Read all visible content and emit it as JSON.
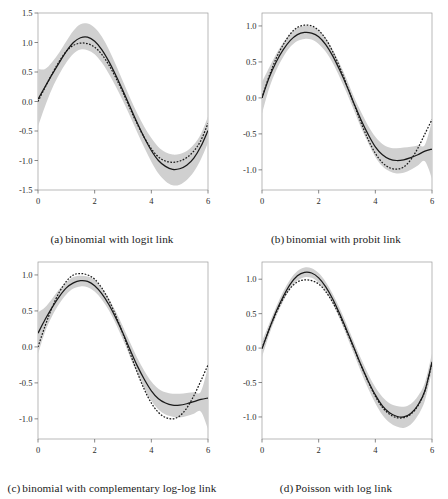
{
  "figure": {
    "title": "",
    "panel_count": 4
  },
  "chart_data": [
    {
      "type": "line",
      "panel": "a",
      "caption_tag": "(a)",
      "caption": "binomial with logit link",
      "title": "binomial with logit link",
      "xlabel": "",
      "ylabel": "",
      "xlim": [
        0,
        6
      ],
      "ylim": [
        -1.5,
        1.5
      ],
      "xticks": [
        0,
        2,
        4,
        6
      ],
      "xticklabels": [
        "0",
        "2",
        "4",
        "6"
      ],
      "yticks": [
        -1.5,
        -1.0,
        -0.5,
        0.0,
        0.5,
        1.0,
        1.5
      ],
      "yticklabels": [
        "-1.5",
        "-1.0",
        "-0.5",
        "0.0",
        "0.5",
        "1.0",
        "1.5"
      ],
      "grid": false,
      "legend": "none",
      "x": [
        0.0,
        0.25,
        0.5,
        0.75,
        1.0,
        1.25,
        1.5,
        1.75,
        2.0,
        2.25,
        2.5,
        2.75,
        3.0,
        3.25,
        3.5,
        3.75,
        4.0,
        4.25,
        4.5,
        4.75,
        5.0,
        5.25,
        5.5,
        5.75,
        6.0
      ],
      "series": [
        {
          "name": "estimate",
          "style": "solid",
          "color": "#1a1a1a",
          "values": [
            0.04,
            0.25,
            0.46,
            0.66,
            0.85,
            1.0,
            1.08,
            1.09,
            1.02,
            0.88,
            0.68,
            0.44,
            0.18,
            -0.09,
            -0.36,
            -0.61,
            -0.83,
            -1.0,
            -1.1,
            -1.15,
            -1.14,
            -1.08,
            -0.96,
            -0.76,
            -0.49
          ]
        },
        {
          "name": "true function",
          "style": "dashed",
          "color": "#1a1a1a",
          "values": [
            0.0,
            0.24,
            0.47,
            0.68,
            0.85,
            0.95,
            0.99,
            0.98,
            0.92,
            0.8,
            0.62,
            0.4,
            0.15,
            -0.12,
            -0.38,
            -0.61,
            -0.8,
            -0.94,
            -1.01,
            -1.03,
            -1.01,
            -0.95,
            -0.84,
            -0.66,
            -0.37
          ]
        },
        {
          "name": "ci-upper",
          "style": "band",
          "color": "#d0d0d0",
          "values": [
            0.55,
            0.55,
            0.67,
            0.83,
            1.02,
            1.2,
            1.31,
            1.32,
            1.25,
            1.1,
            0.88,
            0.62,
            0.34,
            0.06,
            -0.2,
            -0.43,
            -0.62,
            -0.77,
            -0.86,
            -0.9,
            -0.89,
            -0.84,
            -0.73,
            -0.55,
            -0.26
          ]
        },
        {
          "name": "ci-lower",
          "style": "band",
          "color": "#d0d0d0",
          "values": [
            -0.42,
            -0.08,
            0.22,
            0.46,
            0.66,
            0.81,
            0.88,
            0.87,
            0.8,
            0.66,
            0.47,
            0.25,
            0.01,
            -0.25,
            -0.52,
            -0.78,
            -1.02,
            -1.22,
            -1.35,
            -1.42,
            -1.41,
            -1.33,
            -1.19,
            -0.98,
            -0.7
          ]
        }
      ]
    },
    {
      "type": "line",
      "panel": "b",
      "caption_tag": "(b)",
      "caption": "binomial with probit link",
      "title": "binomial with probit link",
      "xlabel": "",
      "ylabel": "",
      "xlim": [
        0,
        6
      ],
      "ylim": [
        -1.28,
        1.18
      ],
      "xticks": [
        0,
        2,
        4,
        6
      ],
      "xticklabels": [
        "0",
        "2",
        "4",
        "6"
      ],
      "yticks": [
        -1.0,
        -0.5,
        0.0,
        0.5,
        1.0
      ],
      "yticklabels": [
        "-1.0",
        "-0.5",
        "0.0",
        "0.5",
        "1.0"
      ],
      "grid": false,
      "legend": "none",
      "x": [
        0.0,
        0.25,
        0.5,
        0.75,
        1.0,
        1.25,
        1.5,
        1.75,
        2.0,
        2.25,
        2.5,
        2.75,
        3.0,
        3.25,
        3.5,
        3.75,
        4.0,
        4.25,
        4.5,
        4.75,
        5.0,
        5.25,
        5.5,
        5.75,
        6.0
      ],
      "series": [
        {
          "name": "estimate",
          "style": "solid",
          "color": "#1a1a1a",
          "values": [
            0.0,
            0.28,
            0.5,
            0.67,
            0.8,
            0.88,
            0.91,
            0.9,
            0.85,
            0.74,
            0.58,
            0.38,
            0.16,
            -0.08,
            -0.31,
            -0.51,
            -0.68,
            -0.79,
            -0.85,
            -0.87,
            -0.86,
            -0.83,
            -0.79,
            -0.74,
            -0.71
          ]
        },
        {
          "name": "true function",
          "style": "dashed",
          "color": "#1a1a1a",
          "values": [
            0.0,
            0.3,
            0.55,
            0.74,
            0.89,
            0.98,
            1.01,
            1.0,
            0.94,
            0.82,
            0.64,
            0.42,
            0.17,
            -0.09,
            -0.35,
            -0.58,
            -0.77,
            -0.9,
            -0.97,
            -0.99,
            -0.96,
            -0.86,
            -0.7,
            -0.5,
            -0.3
          ]
        },
        {
          "name": "ci-upper",
          "style": "band",
          "color": "#d0d0d0",
          "values": [
            0.22,
            0.42,
            0.61,
            0.77,
            0.89,
            0.97,
            1.0,
            0.99,
            0.94,
            0.83,
            0.67,
            0.47,
            0.25,
            0.01,
            -0.2,
            -0.39,
            -0.54,
            -0.64,
            -0.69,
            -0.7,
            -0.69,
            -0.68,
            -0.66,
            -0.65,
            -0.32
          ]
        },
        {
          "name": "ci-lower",
          "style": "band",
          "color": "#d0d0d0",
          "values": [
            -0.22,
            0.13,
            0.38,
            0.57,
            0.71,
            0.79,
            0.82,
            0.81,
            0.75,
            0.64,
            0.48,
            0.28,
            0.06,
            -0.18,
            -0.42,
            -0.63,
            -0.82,
            -0.95,
            -1.02,
            -1.05,
            -1.04,
            -1.0,
            -0.94,
            -0.88,
            -1.12
          ]
        }
      ]
    },
    {
      "type": "line",
      "panel": "c",
      "caption_tag": "(c)",
      "caption": "binomial with complementary log-log link",
      "title": "binomial with complementary log-log link",
      "xlabel": "",
      "ylabel": "",
      "xlim": [
        0,
        6
      ],
      "ylim": [
        -1.28,
        1.18
      ],
      "xticks": [
        0,
        2,
        4,
        6
      ],
      "xticklabels": [
        "0",
        "2",
        "4",
        "6"
      ],
      "yticks": [
        -1.0,
        -0.5,
        0.0,
        0.5,
        1.0
      ],
      "yticklabels": [
        "-1.0",
        "-0.5",
        "0.0",
        "0.5",
        "1.0"
      ],
      "grid": false,
      "legend": "none",
      "x": [
        0.0,
        0.25,
        0.5,
        0.75,
        1.0,
        1.25,
        1.5,
        1.75,
        2.0,
        2.25,
        2.5,
        2.75,
        3.0,
        3.25,
        3.5,
        3.75,
        4.0,
        4.25,
        4.5,
        4.75,
        5.0,
        5.25,
        5.5,
        5.75,
        6.0
      ],
      "series": [
        {
          "name": "estimate",
          "style": "solid",
          "color": "#1a1a1a",
          "values": [
            0.19,
            0.38,
            0.55,
            0.7,
            0.82,
            0.89,
            0.92,
            0.91,
            0.85,
            0.74,
            0.59,
            0.4,
            0.19,
            -0.04,
            -0.26,
            -0.45,
            -0.61,
            -0.72,
            -0.78,
            -0.81,
            -0.81,
            -0.79,
            -0.76,
            -0.73,
            -0.71
          ]
        },
        {
          "name": "true function",
          "style": "dashed",
          "color": "#1a1a1a",
          "values": [
            0.0,
            0.29,
            0.55,
            0.76,
            0.91,
            1.0,
            1.02,
            1.0,
            0.94,
            0.82,
            0.65,
            0.43,
            0.18,
            -0.09,
            -0.35,
            -0.59,
            -0.78,
            -0.91,
            -0.98,
            -1.0,
            -0.96,
            -0.85,
            -0.68,
            -0.47,
            -0.25
          ]
        },
        {
          "name": "ci-upper",
          "style": "band",
          "color": "#d0d0d0",
          "values": [
            0.48,
            0.55,
            0.67,
            0.8,
            0.9,
            0.97,
            0.99,
            0.98,
            0.93,
            0.82,
            0.67,
            0.49,
            0.28,
            0.06,
            -0.15,
            -0.33,
            -0.48,
            -0.58,
            -0.63,
            -0.65,
            -0.65,
            -0.64,
            -0.63,
            -0.62,
            -0.28
          ]
        },
        {
          "name": "ci-lower",
          "style": "band",
          "color": "#d0d0d0",
          "values": [
            -0.1,
            0.21,
            0.43,
            0.6,
            0.73,
            0.81,
            0.84,
            0.83,
            0.77,
            0.66,
            0.51,
            0.32,
            0.1,
            -0.14,
            -0.37,
            -0.58,
            -0.75,
            -0.87,
            -0.94,
            -0.97,
            -0.98,
            -0.96,
            -0.93,
            -0.9,
            -1.14
          ]
        }
      ]
    },
    {
      "type": "line",
      "panel": "d",
      "caption_tag": "(d)",
      "caption": "Poisson with log link",
      "title": "Poisson with log link",
      "xlabel": "",
      "ylabel": "",
      "xlim": [
        0,
        6
      ],
      "ylim": [
        -1.32,
        1.25
      ],
      "xticks": [
        0,
        2,
        4,
        6
      ],
      "xticklabels": [
        "0",
        "2",
        "4",
        "6"
      ],
      "yticks": [
        -1.0,
        -0.5,
        0.0,
        0.5,
        1.0
      ],
      "yticklabels": [
        "-1.0",
        "-0.5",
        "0.0",
        "0.5",
        "1.0"
      ],
      "grid": false,
      "legend": "none",
      "x": [
        0.0,
        0.25,
        0.5,
        0.75,
        1.0,
        1.25,
        1.5,
        1.75,
        2.0,
        2.25,
        2.5,
        2.75,
        3.0,
        3.25,
        3.5,
        3.75,
        4.0,
        4.25,
        4.5,
        4.75,
        5.0,
        5.25,
        5.5,
        5.75,
        6.0
      ],
      "series": [
        {
          "name": "estimate",
          "style": "solid",
          "color": "#1a1a1a",
          "values": [
            -0.01,
            0.27,
            0.53,
            0.75,
            0.93,
            1.05,
            1.1,
            1.09,
            1.02,
            0.89,
            0.71,
            0.49,
            0.25,
            0.0,
            -0.25,
            -0.48,
            -0.68,
            -0.84,
            -0.94,
            -0.99,
            -1.0,
            -0.95,
            -0.83,
            -0.62,
            -0.2
          ]
        },
        {
          "name": "true function",
          "style": "dashed",
          "color": "#1a1a1a",
          "values": [
            0.0,
            0.27,
            0.51,
            0.72,
            0.87,
            0.96,
            0.99,
            0.98,
            0.93,
            0.82,
            0.66,
            0.46,
            0.23,
            -0.01,
            -0.26,
            -0.49,
            -0.7,
            -0.86,
            -0.96,
            -1.01,
            -1.01,
            -0.96,
            -0.84,
            -0.62,
            -0.22
          ]
        },
        {
          "name": "ci-upper",
          "style": "band",
          "color": "#d0d0d0",
          "values": [
            0.1,
            0.35,
            0.6,
            0.82,
            1.0,
            1.12,
            1.17,
            1.16,
            1.09,
            0.96,
            0.78,
            0.57,
            0.33,
            0.08,
            -0.16,
            -0.38,
            -0.57,
            -0.71,
            -0.8,
            -0.84,
            -0.85,
            -0.81,
            -0.7,
            -0.5,
            -0.08
          ]
        },
        {
          "name": "ci-lower",
          "style": "band",
          "color": "#d0d0d0",
          "values": [
            -0.13,
            0.19,
            0.46,
            0.68,
            0.86,
            0.98,
            1.03,
            1.02,
            0.95,
            0.82,
            0.64,
            0.42,
            0.17,
            -0.09,
            -0.35,
            -0.59,
            -0.8,
            -0.97,
            -1.08,
            -1.14,
            -1.16,
            -1.11,
            -0.98,
            -0.76,
            -0.33
          ]
        }
      ]
    }
  ]
}
